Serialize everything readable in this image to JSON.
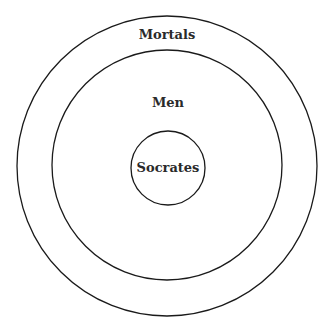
{
  "diagram": {
    "type": "euler-nested-circles",
    "stroke_color": "#1a1a1a",
    "background": "#ffffff",
    "sets": [
      {
        "label": "Mortals",
        "cx": 167,
        "cy": 166,
        "r": 150,
        "label_x": 167,
        "label_y": 39
      },
      {
        "label": "Men",
        "cx": 167,
        "cy": 165,
        "r": 115,
        "label_x": 168,
        "label_y": 107
      },
      {
        "label": "Socrates",
        "cx": 168,
        "cy": 168,
        "r": 37,
        "label_x": 168,
        "label_y": 172
      }
    ]
  }
}
